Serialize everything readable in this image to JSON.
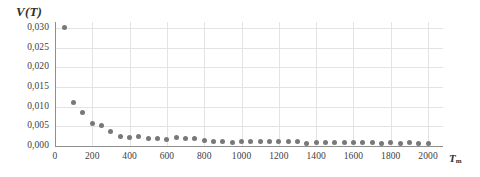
{
  "chart_data": {
    "type": "scatter",
    "title": "",
    "subtitle": "",
    "ylabel": "V̇(T̄)",
    "ylabel_parts": {
      "symbol": "V",
      "accent": "dot",
      "arg": "T",
      "arg_accent": "dot"
    },
    "xlabel": "T",
    "xlabel_sub": "m",
    "x": [
      50,
      100,
      150,
      200,
      250,
      300,
      350,
      400,
      450,
      500,
      550,
      600,
      650,
      700,
      750,
      800,
      850,
      900,
      950,
      1000,
      1050,
      1100,
      1150,
      1200,
      1250,
      1300,
      1350,
      1400,
      1450,
      1500,
      1550,
      1600,
      1650,
      1700,
      1750,
      1800,
      1850,
      1900,
      1950,
      2000
    ],
    "values": [
      0.03,
      0.011,
      0.0085,
      0.0056,
      0.0051,
      0.0036,
      0.0025,
      0.0021,
      0.0024,
      0.0018,
      0.0018,
      0.0016,
      0.0021,
      0.0018,
      0.0018,
      0.0014,
      0.0011,
      0.0012,
      0.001,
      0.0012,
      0.0011,
      0.0012,
      0.0011,
      0.0011,
      0.0011,
      0.0012,
      0.0007,
      0.0008,
      0.0008,
      0.0008,
      0.0008,
      0.0008,
      0.0008,
      0.0008,
      0.0007,
      0.0008,
      0.0007,
      0.0008,
      0.0007,
      0.0007
    ],
    "xlim": [
      0,
      2080
    ],
    "ylim": [
      0.0,
      0.0315
    ],
    "xticks": [
      0,
      200,
      400,
      600,
      800,
      1000,
      1200,
      1400,
      1600,
      1800,
      2000
    ],
    "xtick_labels": [
      "0",
      "200",
      "400",
      "600",
      "800",
      "1000",
      "1200",
      "1400",
      "1600",
      "1800",
      "2000"
    ],
    "yticks": [
      0.0,
      0.005,
      0.01,
      0.015,
      0.02,
      0.025,
      0.03
    ],
    "ytick_labels": [
      "0,000",
      "0,005",
      "0,010",
      "0,015",
      "0,020",
      "0,025",
      "0,030"
    ],
    "grid": true,
    "grid_color": "#e3e3e3",
    "legend": null,
    "marker_color": "#787878",
    "axis_color": "#8f8f8f",
    "background": "#ffffff"
  }
}
